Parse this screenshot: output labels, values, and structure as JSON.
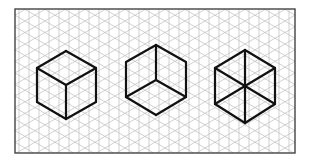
{
  "diagram": {
    "title": "Isometric cube views on isometric grid",
    "background": "#ffffff",
    "frame": {
      "x": 15,
      "y": 9,
      "width": 280,
      "height": 144,
      "stroke": "#444444"
    },
    "grid": {
      "spacing_x": 10,
      "color": "#bdbdbd",
      "angle_deg": 30
    },
    "line_color": "#111111",
    "line_width": 2.2,
    "shapes": [
      {
        "name": "cube-top-view",
        "label": "Cube viewed from above",
        "vertices": {
          "top": [
            66,
            51
          ],
          "upper_left": [
            37,
            68
          ],
          "upper_right": [
            96,
            68
          ],
          "center": [
            66,
            85
          ],
          "lower_left": [
            37,
            102
          ],
          "lower_right": [
            96,
            102
          ],
          "bottom": [
            66,
            119
          ]
        },
        "edges": [
          [
            "top",
            "upper_left"
          ],
          [
            "top",
            "upper_right"
          ],
          [
            "upper_left",
            "center"
          ],
          [
            "upper_right",
            "center"
          ],
          [
            "upper_left",
            "lower_left"
          ],
          [
            "upper_right",
            "lower_right"
          ],
          [
            "center",
            "bottom"
          ],
          [
            "lower_left",
            "bottom"
          ],
          [
            "lower_right",
            "bottom"
          ]
        ]
      },
      {
        "name": "cube-bottom-view",
        "label": "Cube viewed from below (inside corner)",
        "vertices": {
          "top": [
            156,
            45
          ],
          "upper_left": [
            126,
            62
          ],
          "upper_right": [
            186,
            62
          ],
          "center": [
            156,
            80
          ],
          "lower_left": [
            126,
            97
          ],
          "lower_right": [
            186,
            97
          ],
          "bottom": [
            156,
            115
          ]
        },
        "edges": [
          [
            "top",
            "upper_left"
          ],
          [
            "top",
            "upper_right"
          ],
          [
            "upper_left",
            "lower_left"
          ],
          [
            "upper_right",
            "lower_right"
          ],
          [
            "top",
            "center"
          ],
          [
            "center",
            "lower_left"
          ],
          [
            "center",
            "lower_right"
          ],
          [
            "lower_left",
            "bottom"
          ],
          [
            "lower_right",
            "bottom"
          ]
        ]
      },
      {
        "name": "hexagon-all-diagonals",
        "label": "Hexagon with all three diagonals",
        "vertices": {
          "top": [
            245,
            50
          ],
          "upper_left": [
            215,
            68
          ],
          "upper_right": [
            275,
            68
          ],
          "center": [
            245,
            86
          ],
          "lower_left": [
            215,
            104
          ],
          "lower_right": [
            275,
            104
          ],
          "bottom": [
            245,
            123
          ]
        },
        "edges": [
          [
            "top",
            "upper_left"
          ],
          [
            "top",
            "upper_right"
          ],
          [
            "upper_left",
            "lower_left"
          ],
          [
            "upper_right",
            "lower_right"
          ],
          [
            "lower_left",
            "bottom"
          ],
          [
            "lower_right",
            "bottom"
          ],
          [
            "top",
            "bottom"
          ],
          [
            "upper_left",
            "lower_right"
          ],
          [
            "upper_right",
            "lower_left"
          ]
        ]
      }
    ]
  }
}
